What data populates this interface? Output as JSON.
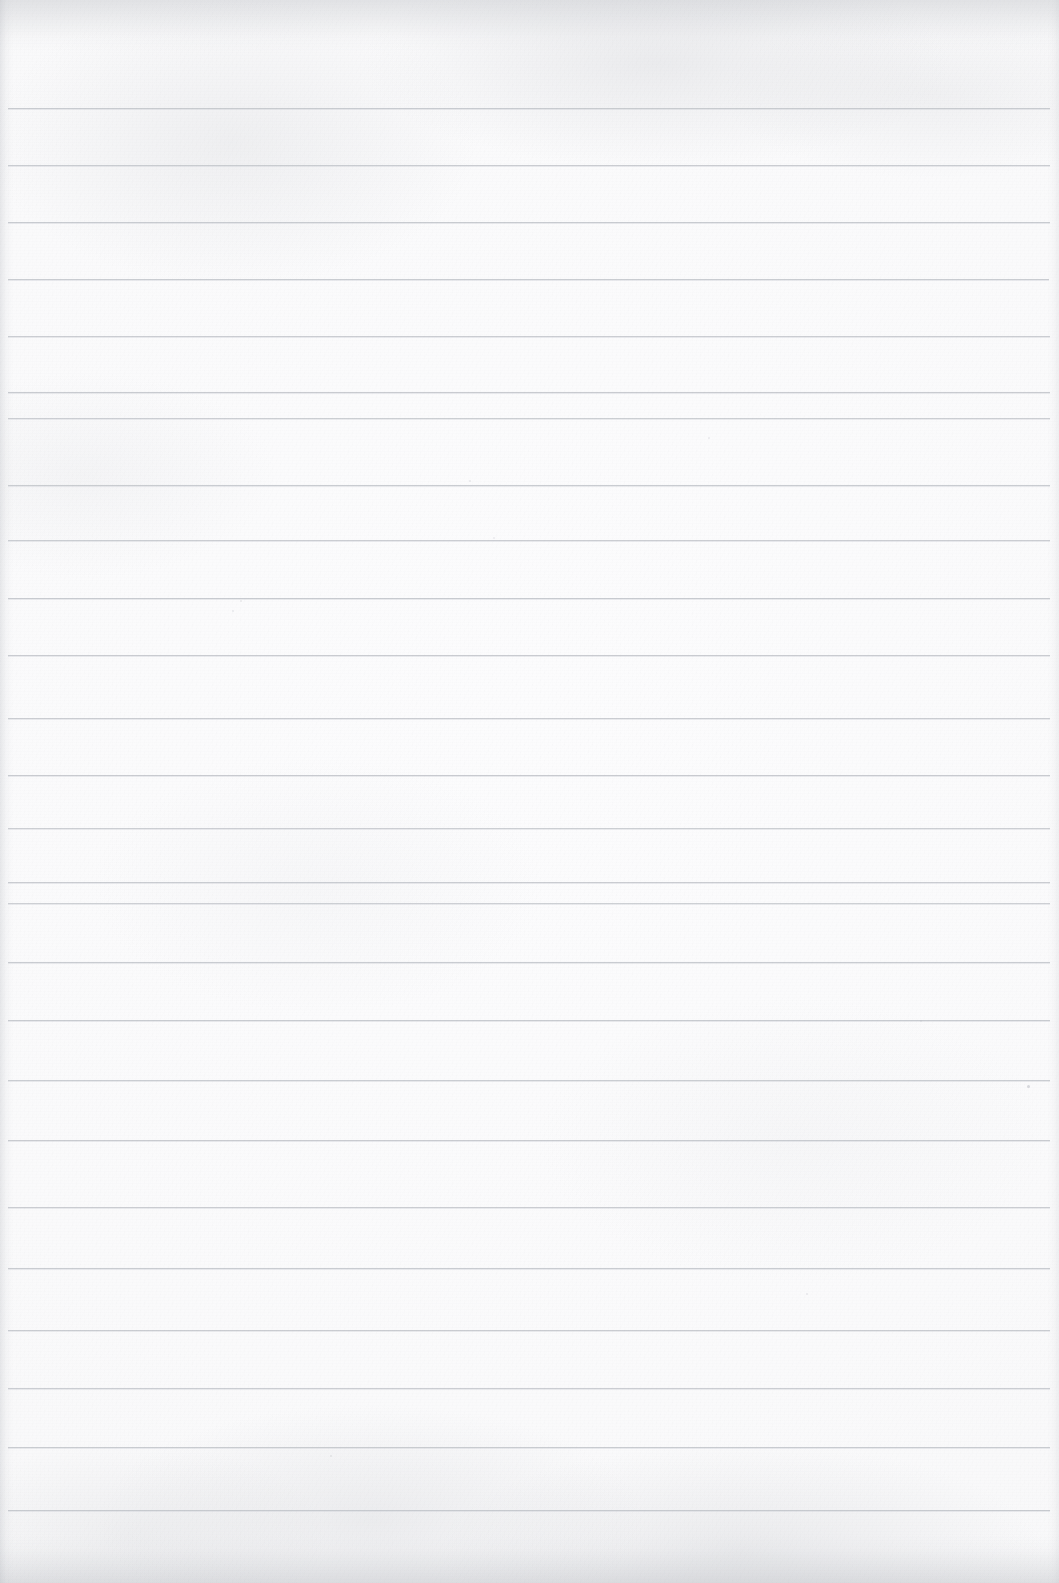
{
  "document": {
    "kind": "scanned-blank-ruled-notebook-page",
    "title": "Blank Lined Notebook Page",
    "has_text_content": false,
    "visible_text": "",
    "page_width": 1059,
    "page_height": 1583
  },
  "paper": {
    "background_color": "#fbfbfc",
    "base_tone_color": "#fafafb",
    "vignette_color": "#f7f7f8",
    "grain_color": "#aaacb2",
    "edge_shade_color": "#b2b5bb"
  },
  "ruling": {
    "line_color": "#c6c9ce",
    "line_secondary_color": "#ced1d6",
    "line_thickness_px": 1,
    "line_spacing_px": 57,
    "line_start_x": 8,
    "line_end_x": 1050,
    "line_count": 25,
    "first_line_y": 108,
    "last_line_y": 1510,
    "y_positions": [
      108,
      165,
      222,
      279,
      336,
      392,
      418,
      485,
      540,
      598,
      655,
      718,
      775,
      828,
      882,
      903,
      962,
      1020,
      1080,
      1140,
      1207,
      1268,
      1330,
      1388,
      1447,
      1510
    ]
  },
  "lines": [
    {
      "index": 1,
      "y": 108,
      "x_start": 8,
      "x_end": 1050,
      "opacity": 0.95
    },
    {
      "index": 2,
      "y": 165,
      "x_start": 8,
      "x_end": 1050,
      "opacity": 0.92
    },
    {
      "index": 3,
      "y": 222,
      "x_start": 8,
      "x_end": 1050,
      "opacity": 0.95
    },
    {
      "index": 4,
      "y": 279,
      "x_start": 8,
      "x_end": 1049,
      "opacity": 0.93
    },
    {
      "index": 5,
      "y": 336,
      "x_start": 8,
      "x_end": 1050,
      "opacity": 0.9
    },
    {
      "index": 6,
      "y": 392,
      "x_start": 8,
      "x_end": 1050,
      "opacity": 0.94
    },
    {
      "index": 7,
      "y": 418,
      "x_start": 8,
      "x_end": 1050,
      "opacity": 0.88
    },
    {
      "index": 8,
      "y": 485,
      "x_start": 8,
      "x_end": 1050,
      "opacity": 0.93
    },
    {
      "index": 9,
      "y": 540,
      "x_start": 8,
      "x_end": 1050,
      "opacity": 0.9
    },
    {
      "index": 10,
      "y": 598,
      "x_start": 8,
      "x_end": 1050,
      "opacity": 0.95
    },
    {
      "index": 11,
      "y": 655,
      "x_start": 8,
      "x_end": 1050,
      "opacity": 0.92
    },
    {
      "index": 12,
      "y": 718,
      "x_start": 8,
      "x_end": 1050,
      "opacity": 0.9
    },
    {
      "index": 13,
      "y": 775,
      "x_start": 8,
      "x_end": 1050,
      "opacity": 0.94
    },
    {
      "index": 14,
      "y": 828,
      "x_start": 8,
      "x_end": 1050,
      "opacity": 0.88
    },
    {
      "index": 15,
      "y": 882,
      "x_start": 8,
      "x_end": 1050,
      "opacity": 0.92
    },
    {
      "index": 16,
      "y": 903,
      "x_start": 8,
      "x_end": 1050,
      "opacity": 0.86
    },
    {
      "index": 17,
      "y": 962,
      "x_start": 8,
      "x_end": 1050,
      "opacity": 0.93
    },
    {
      "index": 18,
      "y": 1020,
      "x_start": 8,
      "x_end": 1050,
      "opacity": 0.95
    },
    {
      "index": 19,
      "y": 1080,
      "x_start": 8,
      "x_end": 1050,
      "opacity": 0.91
    },
    {
      "index": 20,
      "y": 1140,
      "x_start": 8,
      "x_end": 1050,
      "opacity": 0.94
    },
    {
      "index": 21,
      "y": 1207,
      "x_start": 8,
      "x_end": 1050,
      "opacity": 0.9
    },
    {
      "index": 22,
      "y": 1268,
      "x_start": 8,
      "x_end": 1050,
      "opacity": 0.93
    },
    {
      "index": 23,
      "y": 1330,
      "x_start": 8,
      "x_end": 1050,
      "opacity": 0.92
    },
    {
      "index": 24,
      "y": 1388,
      "x_start": 8,
      "x_end": 1050,
      "opacity": 0.9
    },
    {
      "index": 25,
      "y": 1447,
      "x_start": 8,
      "x_end": 1050,
      "opacity": 0.93
    },
    {
      "index": 26,
      "y": 1510,
      "x_start": 8,
      "x_end": 1050,
      "opacity": 0.96
    }
  ],
  "specks": [
    {
      "x": 1027,
      "y": 1085,
      "size": 3,
      "opacity": 0.55
    },
    {
      "x": 469,
      "y": 480,
      "size": 2,
      "opacity": 0.3
    },
    {
      "x": 240,
      "y": 600,
      "size": 2,
      "opacity": 0.28
    },
    {
      "x": 232,
      "y": 610,
      "size": 1.5,
      "opacity": 0.25
    },
    {
      "x": 806,
      "y": 1293,
      "size": 2,
      "opacity": 0.3
    },
    {
      "x": 330,
      "y": 1455,
      "size": 2,
      "opacity": 0.32
    },
    {
      "x": 493,
      "y": 537,
      "size": 1.5,
      "opacity": 0.22
    },
    {
      "x": 708,
      "y": 437,
      "size": 1.5,
      "opacity": 0.22
    },
    {
      "x": 920,
      "y": 1020,
      "size": 1.5,
      "opacity": 0.24
    }
  ]
}
